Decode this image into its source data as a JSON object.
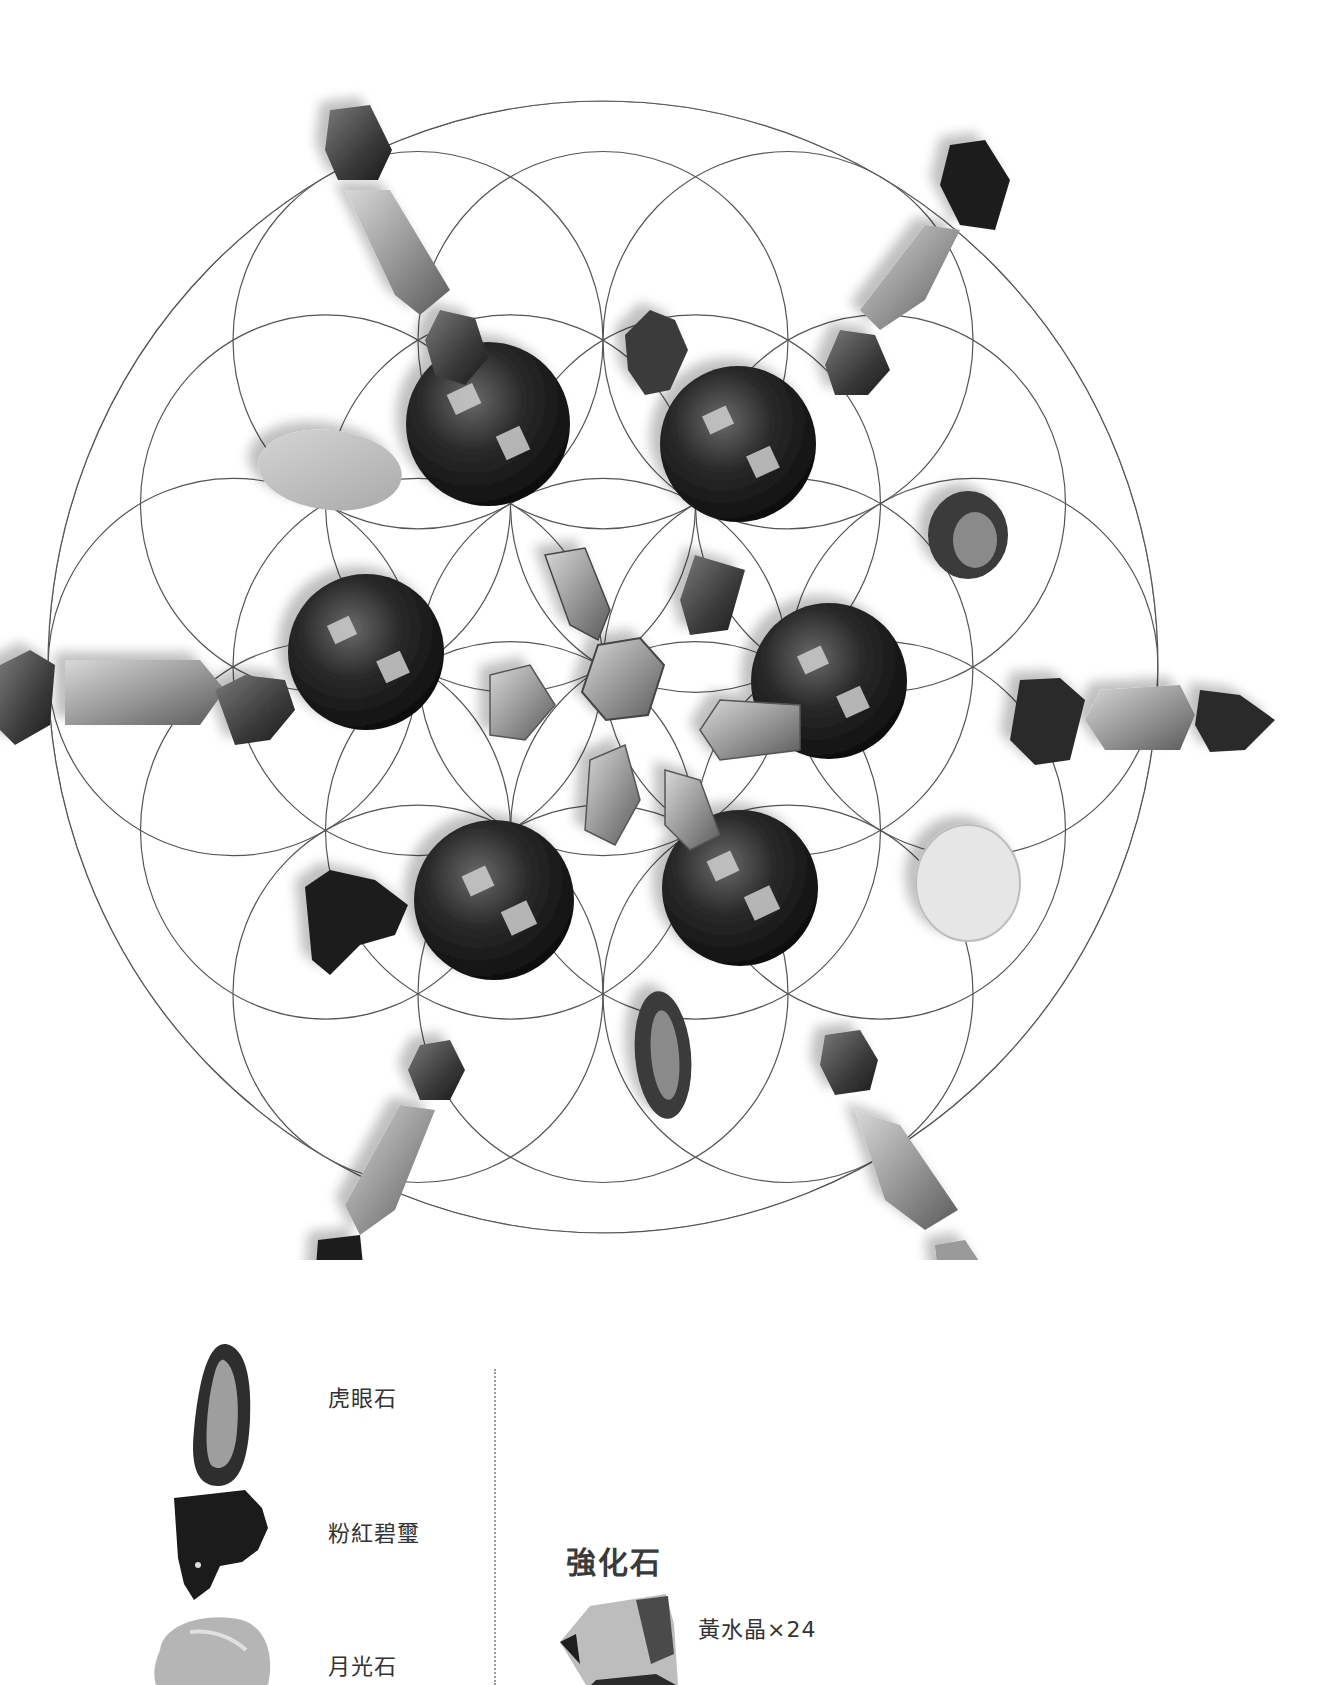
{
  "grid": {
    "pattern": "flower-of-life",
    "center": [
      603,
      667
    ],
    "outer_radius": [
      555,
      567
    ],
    "line_color": "#555555",
    "stones": [
      {
        "type": "sphere",
        "name": "虎眼石 sphere",
        "cx": 488,
        "cy": 424,
        "r": 82
      },
      {
        "type": "sphere",
        "name": "虎眼石 sphere",
        "cx": 738,
        "cy": 444,
        "r": 78
      },
      {
        "type": "sphere",
        "name": "虎眼石 sphere",
        "cx": 366,
        "cy": 652,
        "r": 78
      },
      {
        "type": "sphere",
        "name": "虎眼石 sphere",
        "cx": 829,
        "cy": 681,
        "r": 78
      },
      {
        "type": "sphere",
        "name": "虎眼石 sphere",
        "cx": 494,
        "cy": 900,
        "r": 80
      },
      {
        "type": "sphere",
        "name": "虎眼石 sphere",
        "cx": 740,
        "cy": 888,
        "r": 78
      }
    ]
  },
  "legend": {
    "left_items": [
      {
        "label": "虎眼石",
        "shape": "tumbled-long"
      },
      {
        "label": "粉紅碧璽",
        "shape": "rough-chunk"
      },
      {
        "label": "月光石",
        "shape": "tumbled-oval"
      }
    ],
    "right_section": {
      "title": "強化石",
      "items": [
        {
          "label": "黃水晶×24",
          "shape": "point-crystal"
        }
      ]
    }
  }
}
